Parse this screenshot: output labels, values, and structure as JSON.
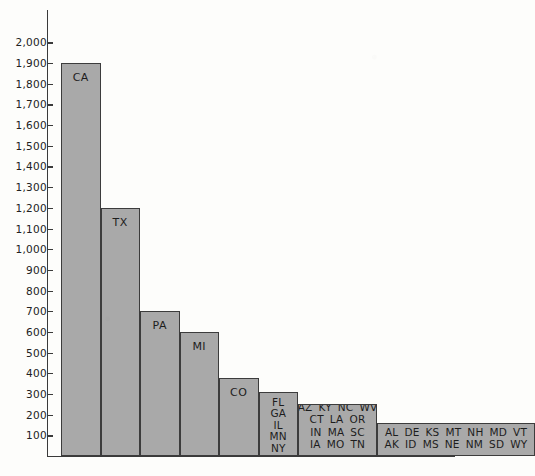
{
  "chart_data": {
    "type": "bar",
    "title": "",
    "xlabel": "",
    "ylabel": "",
    "ylim": [
      0,
      2000
    ],
    "grid": false,
    "legend": null,
    "axis": {
      "y_ticks": [
        100,
        200,
        300,
        400,
        500,
        600,
        700,
        800,
        900,
        1000,
        1100,
        1200,
        1300,
        1400,
        1500,
        1600,
        1700,
        1800,
        1900,
        2000
      ],
      "y_tick_labels": [
        "100",
        "200",
        "300",
        "400",
        "500",
        "600",
        "700",
        "800",
        "900",
        "1,000",
        "1,100",
        "1,200",
        "1,300",
        "1,400",
        "1,500",
        "1,600",
        "1,700",
        "1,800",
        "1,900",
        "2,000"
      ]
    },
    "categories": [
      "CA",
      "TX",
      "PA",
      "MI",
      "CO",
      "FL GA IL MN NY WA",
      "AZ CT IN IA KY LA MA MO NC OR SC TN WV",
      "AL AK DE ID KS MS MT NE NH NM MD SD VT WY"
    ],
    "values": [
      1900,
      1200,
      700,
      600,
      375,
      310,
      250,
      160
    ],
    "bars": [
      {
        "id": "bar-ca",
        "value": 1900,
        "label_kind": "single",
        "label": "CA",
        "states": [
          "CA"
        ],
        "width_units": 1
      },
      {
        "id": "bar-tx",
        "value": 1200,
        "label_kind": "single",
        "label": "TX",
        "states": [
          "TX"
        ],
        "width_units": 1
      },
      {
        "id": "bar-pa",
        "value": 700,
        "label_kind": "single",
        "label": "PA",
        "states": [
          "PA"
        ],
        "width_units": 1
      },
      {
        "id": "bar-mi",
        "value": 600,
        "label_kind": "single",
        "label": "MI",
        "states": [
          "MI"
        ],
        "width_units": 1
      },
      {
        "id": "bar-co",
        "value": 375,
        "label_kind": "single",
        "label": "CO",
        "states": [
          "CO"
        ],
        "width_units": 1
      },
      {
        "id": "bar-group-6",
        "value": 310,
        "label_kind": "grid",
        "rows": [
          [
            "FL"
          ],
          [
            "GA"
          ],
          [
            "IL"
          ],
          [
            "MN"
          ],
          [
            "NY"
          ],
          [
            "WA"
          ]
        ],
        "states": [
          "FL",
          "GA",
          "IL",
          "MN",
          "NY",
          "WA"
        ],
        "width_units": 1
      },
      {
        "id": "bar-group-13",
        "value": 250,
        "label_kind": "grid",
        "rows": [
          [
            "AZ",
            "KY",
            "NC",
            "WV"
          ],
          [
            "CT",
            "LA",
            "OR"
          ],
          [
            "IN",
            "MA",
            "SC"
          ],
          [
            "IA",
            "MO",
            "TN"
          ]
        ],
        "states": [
          "AZ",
          "KY",
          "NC",
          "WV",
          "CT",
          "LA",
          "OR",
          "IN",
          "MA",
          "SC",
          "IA",
          "MO",
          "TN"
        ],
        "width_units": 2
      },
      {
        "id": "bar-group-14",
        "value": 160,
        "label_kind": "grid",
        "rows": [
          [
            "AL",
            "DE",
            "KS",
            "MT",
            "NH",
            "MD",
            "VT"
          ],
          [
            "AK",
            "ID",
            "MS",
            "NE",
            "NM",
            "SD",
            "WY"
          ]
        ],
        "states": [
          "AL",
          "DE",
          "KS",
          "MT",
          "NH",
          "MD",
          "VT",
          "AK",
          "ID",
          "MS",
          "NE",
          "NM",
          "SD",
          "WY"
        ],
        "width_units": 4
      }
    ],
    "colors": {
      "bar_fill": "#a9a9a9",
      "bar_stroke": "#3c3c3c",
      "axis": "#3a3a3a",
      "text": "#1d1d1d",
      "background": "#fdfdfb"
    }
  },
  "caption": ""
}
